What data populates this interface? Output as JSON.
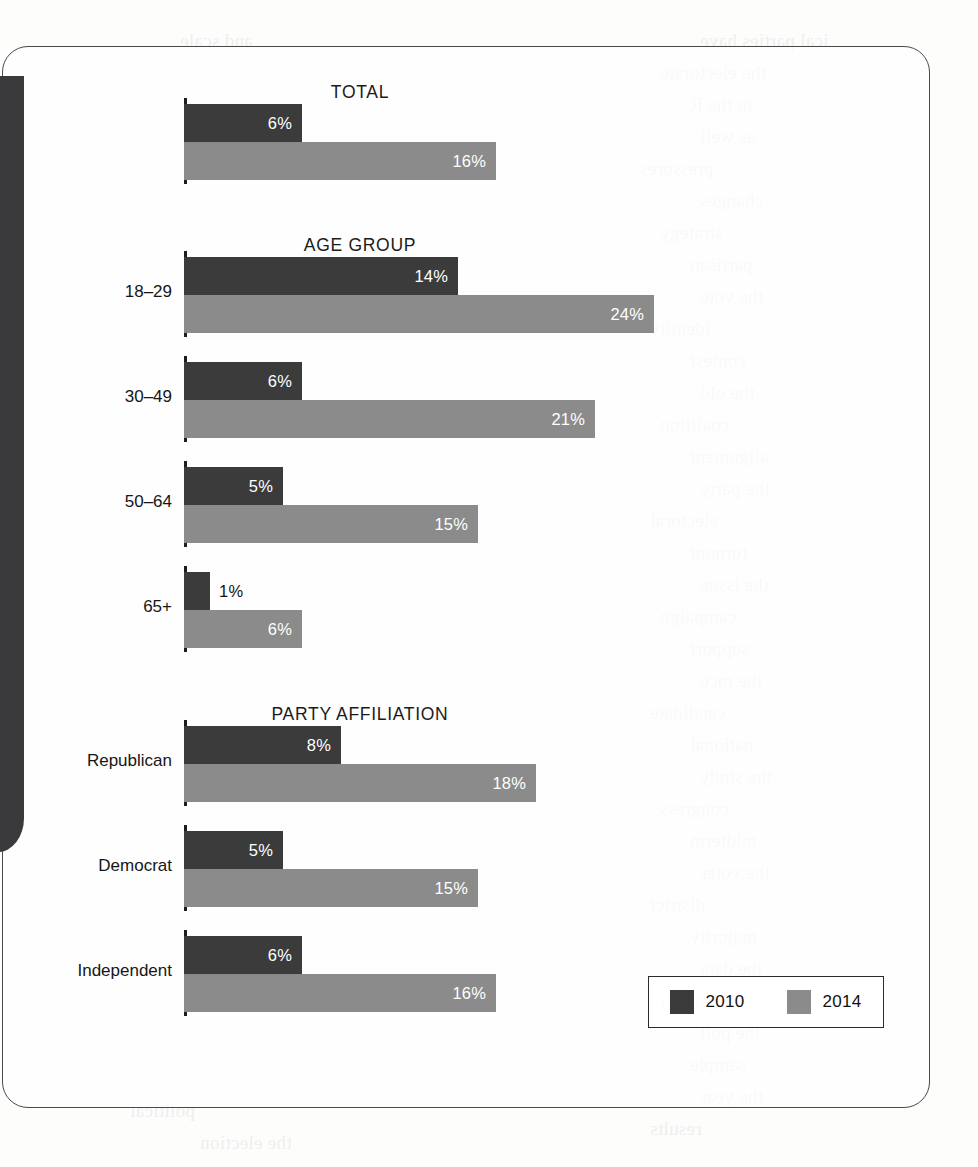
{
  "chart_data": {
    "type": "bar",
    "orientation": "horizontal",
    "title": "",
    "xlabel": "",
    "ylabel": "",
    "xlim": [
      0,
      24
    ],
    "grid": false,
    "legend_position": "bottom-right",
    "value_suffix": "%",
    "series": [
      {
        "name": "2010",
        "color": "#3b3b3b",
        "values": [
          6,
          14,
          6,
          5,
          1,
          8,
          5,
          6
        ]
      },
      {
        "name": "2014",
        "color": "#8b8b8b",
        "values": [
          16,
          24,
          21,
          15,
          6,
          18,
          15,
          16
        ]
      }
    ],
    "categories": [
      "",
      "18–29",
      "30–49",
      "50–64",
      "65+",
      "Republican",
      "Democrat",
      "Independent"
    ],
    "sections": [
      {
        "title": "TOTAL",
        "title_x": 360,
        "title_y": 82,
        "rows": [
          {
            "label": "",
            "axis_top": 98,
            "axis_height": 86,
            "bars": [
              {
                "series": "2010",
                "value": 6,
                "text": "6%",
                "top": 104,
                "width": 118,
                "label_inside": true
              },
              {
                "series": "2014",
                "value": 16,
                "text": "16%",
                "top": 142,
                "width": 312,
                "label_inside": true
              }
            ]
          }
        ]
      },
      {
        "title": "AGE GROUP",
        "title_x": 360,
        "title_y": 235,
        "rows": [
          {
            "label": "18–29",
            "label_y": 292,
            "axis_top": 251,
            "axis_height": 86,
            "bars": [
              {
                "series": "2010",
                "value": 14,
                "text": "14%",
                "top": 257,
                "width": 274,
                "label_inside": true
              },
              {
                "series": "2014",
                "value": 24,
                "text": "24%",
                "top": 295,
                "width": 470,
                "label_inside": true
              }
            ]
          },
          {
            "label": "30–49",
            "label_y": 397,
            "axis_top": 356,
            "axis_height": 86,
            "bars": [
              {
                "series": "2010",
                "value": 6,
                "text": "6%",
                "top": 362,
                "width": 118,
                "label_inside": true
              },
              {
                "series": "2014",
                "value": 21,
                "text": "21%",
                "top": 400,
                "width": 411,
                "label_inside": true
              }
            ]
          },
          {
            "label": "50–64",
            "label_y": 502,
            "axis_top": 461,
            "axis_height": 86,
            "bars": [
              {
                "series": "2010",
                "value": 5,
                "text": "5%",
                "top": 467,
                "width": 99,
                "label_inside": true
              },
              {
                "series": "2014",
                "value": 15,
                "text": "15%",
                "top": 505,
                "width": 294,
                "label_inside": true
              }
            ]
          },
          {
            "label": "65+",
            "label_y": 607,
            "axis_top": 566,
            "axis_height": 86,
            "bars": [
              {
                "series": "2010",
                "value": 1,
                "text": "1%",
                "top": 572,
                "width": 26,
                "label_inside": false
              },
              {
                "series": "2014",
                "value": 6,
                "text": "6%",
                "top": 610,
                "width": 118,
                "label_inside": true
              }
            ]
          }
        ]
      },
      {
        "title": "PARTY AFFILIATION",
        "title_x": 360,
        "title_y": 704,
        "rows": [
          {
            "label": "Republican",
            "label_y": 761,
            "axis_top": 720,
            "axis_height": 86,
            "bars": [
              {
                "series": "2010",
                "value": 8,
                "text": "8%",
                "top": 726,
                "width": 157,
                "label_inside": true
              },
              {
                "series": "2014",
                "value": 18,
                "text": "18%",
                "top": 764,
                "width": 352,
                "label_inside": true
              }
            ]
          },
          {
            "label": "Democrat",
            "label_y": 866,
            "axis_top": 825,
            "axis_height": 86,
            "bars": [
              {
                "series": "2010",
                "value": 5,
                "text": "5%",
                "top": 831,
                "width": 99,
                "label_inside": true
              },
              {
                "series": "2014",
                "value": 15,
                "text": "15%",
                "top": 869,
                "width": 294,
                "label_inside": true
              }
            ]
          },
          {
            "label": "Independent",
            "label_y": 971,
            "axis_top": 930,
            "axis_height": 86,
            "bars": [
              {
                "series": "2010",
                "value": 6,
                "text": "6%",
                "top": 936,
                "width": 118,
                "label_inside": true
              },
              {
                "series": "2014",
                "value": 16,
                "text": "16%",
                "top": 974,
                "width": 312,
                "label_inside": true
              }
            ]
          }
        ]
      }
    ],
    "legend": [
      {
        "label": "2010",
        "color": "#3b3b3b"
      },
      {
        "label": "2014",
        "color": "#8b8b8b"
      }
    ]
  },
  "layout": {
    "axis_x": 184,
    "label_right": 172,
    "px_per_percent": 19.6
  },
  "background_lines": [
    {
      "x": 700,
      "y": 30,
      "text": "ical parties have"
    },
    {
      "x": 660,
      "y": 62,
      "text": "the electorate"
    },
    {
      "x": 690,
      "y": 94,
      "text": "in the R"
    },
    {
      "x": 700,
      "y": 126,
      "text": "as well"
    },
    {
      "x": 640,
      "y": 158,
      "text": "pressures"
    },
    {
      "x": 700,
      "y": 190,
      "text": "changes"
    },
    {
      "x": 660,
      "y": 222,
      "text": "strategy"
    },
    {
      "x": 690,
      "y": 254,
      "text": "partisan"
    },
    {
      "x": 700,
      "y": 286,
      "text": "the vote"
    },
    {
      "x": 650,
      "y": 318,
      "text": "identity"
    },
    {
      "x": 690,
      "y": 350,
      "text": "contest"
    },
    {
      "x": 700,
      "y": 382,
      "text": "the old"
    },
    {
      "x": 660,
      "y": 414,
      "text": "coalition"
    },
    {
      "x": 690,
      "y": 446,
      "text": "alignment"
    },
    {
      "x": 700,
      "y": 478,
      "text": "the party"
    },
    {
      "x": 650,
      "y": 510,
      "text": "electoral"
    },
    {
      "x": 690,
      "y": 542,
      "text": "turnout"
    },
    {
      "x": 700,
      "y": 574,
      "text": "the issue"
    },
    {
      "x": 660,
      "y": 606,
      "text": "campaign"
    },
    {
      "x": 690,
      "y": 638,
      "text": "support"
    },
    {
      "x": 700,
      "y": 670,
      "text": "the race"
    },
    {
      "x": 650,
      "y": 702,
      "text": "candidate"
    },
    {
      "x": 690,
      "y": 734,
      "text": "national"
    },
    {
      "x": 700,
      "y": 766,
      "text": "the study"
    },
    {
      "x": 660,
      "y": 798,
      "text": "congress"
    },
    {
      "x": 690,
      "y": 830,
      "text": "midterm"
    },
    {
      "x": 700,
      "y": 862,
      "text": "the voter"
    },
    {
      "x": 650,
      "y": 894,
      "text": "district"
    },
    {
      "x": 690,
      "y": 926,
      "text": "majority"
    },
    {
      "x": 700,
      "y": 958,
      "text": "the data"
    },
    {
      "x": 660,
      "y": 990,
      "text": "percent"
    },
    {
      "x": 700,
      "y": 1022,
      "text": "the poll"
    },
    {
      "x": 690,
      "y": 1054,
      "text": "sample"
    },
    {
      "x": 700,
      "y": 1086,
      "text": "the year"
    },
    {
      "x": 650,
      "y": 1118,
      "text": "results"
    },
    {
      "x": 180,
      "y": 30,
      "text": "and scale"
    },
    {
      "x": 130,
      "y": 1100,
      "text": "political"
    },
    {
      "x": 200,
      "y": 1132,
      "text": "the election"
    }
  ]
}
